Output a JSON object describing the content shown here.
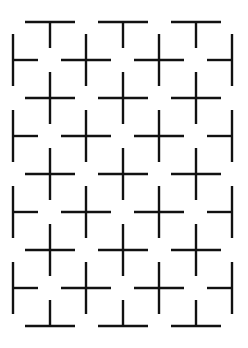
{
  "figure": {
    "stroke_color": "#111111",
    "stroke_width": 2.4,
    "half_length": 25,
    "rows_a": {
      "x_centers": [
        50,
        123,
        196
      ],
      "y_top_t": 22,
      "y_crosses": [
        98,
        174,
        250
      ],
      "y_bottom_inverted_t": 326
    },
    "rows_b": {
      "x_centers": [
        13,
        86,
        159,
        232
      ],
      "y_centers": [
        60,
        136,
        212,
        288
      ]
    }
  }
}
